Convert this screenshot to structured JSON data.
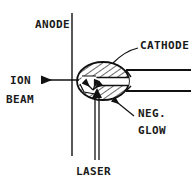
{
  "figure": {
    "type": "technical-line-diagram",
    "stroke_color": "#111111",
    "background_color": "#ffffff"
  },
  "labels": {
    "anode": "ANODE",
    "ion": "ION",
    "beam": "BEAM",
    "cathode": "CATHODE",
    "neg": "NEG.",
    "glow": "GLOW",
    "laser": "LASER"
  },
  "components": {
    "anode_plate": {
      "name": "anode",
      "shape": "vertical-line",
      "x": 72,
      "y_top": 13,
      "y_bottom": 156
    },
    "cathode_body": {
      "name": "cathode",
      "shape": "hatched-ellipse",
      "center_x": 103,
      "center_y": 81,
      "radius_x": 26,
      "radius_y": 19,
      "fill": "diagonal-hatch"
    },
    "bore_channel": {
      "name": "cathode-bore",
      "shape": "horizontal-channel",
      "y_top": 77,
      "y_bottom": 86
    },
    "tube": {
      "name": "cathode-tube",
      "shape": "open-tube",
      "x_start": 128,
      "x_end": 191,
      "y_top": 70,
      "y_bottom": 91
    },
    "ion_beam_arrow": {
      "name": "ion-beam-arrow",
      "direction": "left",
      "x_tail": 79,
      "x_head": 38,
      "y": 80
    },
    "laser_beam": {
      "name": "laser-beam",
      "direction": "up",
      "x_left": 95,
      "x_right": 99,
      "y_bottom": 160,
      "y_head": 92
    },
    "negative_glow": {
      "name": "negative-glow",
      "shape": "small-clear-region-with-arrows"
    }
  }
}
